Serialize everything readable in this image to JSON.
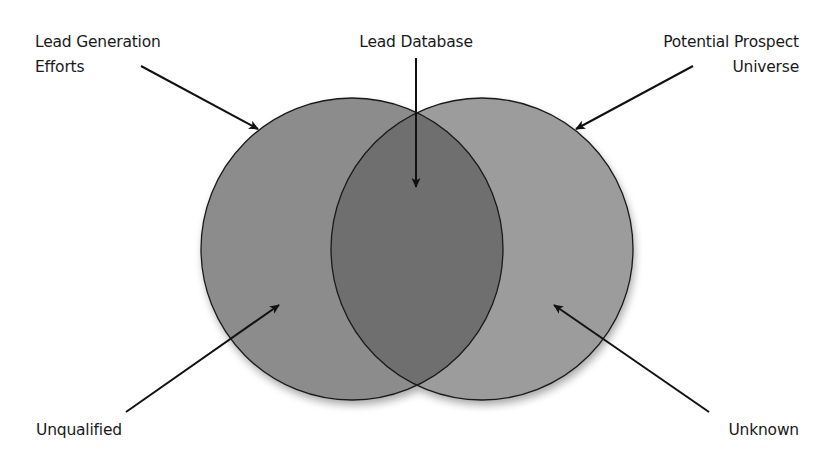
{
  "diagram": {
    "type": "venn",
    "colors": {
      "left_circle": "#8c8c8c",
      "right_circle": "#9c9c9c",
      "overlap": "#6f6f6f",
      "stroke": "#1a1a1a",
      "background": "#ffffff"
    },
    "circles": [
      {
        "id": "left",
        "cx": 352,
        "cy": 249,
        "r": 151
      },
      {
        "id": "right",
        "cx": 482,
        "cy": 249,
        "r": 151
      }
    ],
    "labels": {
      "lead_generation": {
        "line1": "Lead Generation",
        "line2": "Efforts"
      },
      "lead_database": {
        "line1": "Lead Database"
      },
      "potential_prospect": {
        "line1": "Potential Prospect",
        "line2": "Universe"
      },
      "unqualified": {
        "line1": "Unqualified"
      },
      "unknown": {
        "line1": "Unknown"
      }
    },
    "arrows": [
      {
        "from": "lead_generation",
        "x1": 141,
        "y1": 66,
        "x2": 258,
        "y2": 129
      },
      {
        "from": "lead_database",
        "x1": 416,
        "y1": 58,
        "x2": 416,
        "y2": 187
      },
      {
        "from": "potential_prospect",
        "x1": 693,
        "y1": 66,
        "x2": 576,
        "y2": 129
      },
      {
        "from": "unqualified",
        "x1": 126,
        "y1": 412,
        "x2": 279,
        "y2": 305
      },
      {
        "from": "unknown",
        "x1": 709,
        "y1": 412,
        "x2": 554,
        "y2": 305
      }
    ]
  }
}
